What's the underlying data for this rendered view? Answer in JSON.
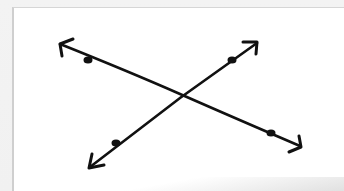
{
  "diagram": {
    "type": "intersecting-lines",
    "description": "Two straight lines with arrowheads on both ends crossing at a single point; each line has two marked points.",
    "stroke_color": "#111111",
    "paper_color": "#ffffff",
    "background_color": "#f1f1f1",
    "lines": [
      {
        "name": "line-descending",
        "start": [
          59,
          43
        ],
        "end": [
          301,
          147
        ],
        "arrow_both_ends": true,
        "points": [
          [
            88,
            60
          ],
          [
            271,
            133
          ]
        ]
      },
      {
        "name": "line-ascending",
        "start": [
          89,
          168
        ],
        "end": [
          258,
          42
        ],
        "arrow_both_ends": true,
        "points": [
          [
            116,
            143
          ],
          [
            232,
            60
          ]
        ]
      }
    ],
    "intersection": [
      180,
      96
    ]
  }
}
